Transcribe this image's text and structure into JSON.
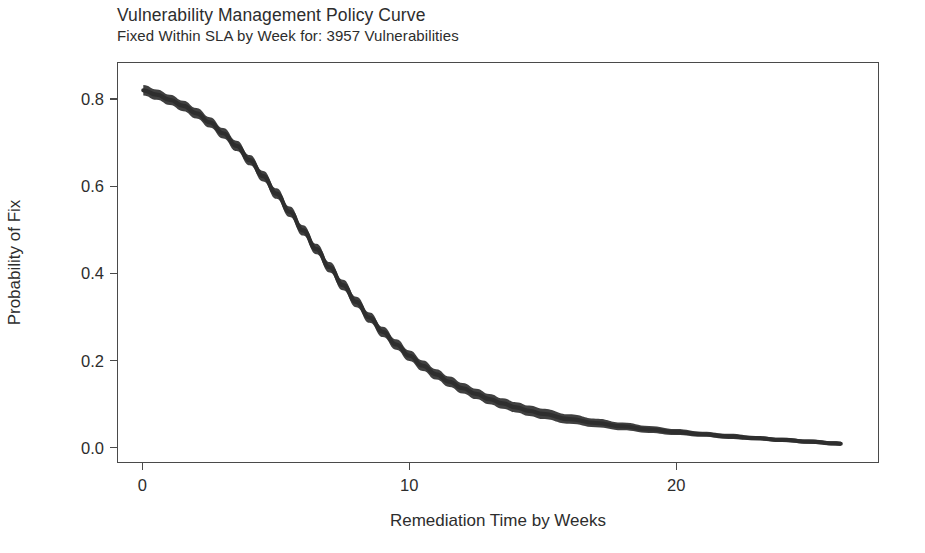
{
  "chart_data": {
    "type": "line",
    "title": "Vulnerability Management Policy Curve",
    "subtitle": "Fixed Within SLA by  Week for: 3957 Vulnerabilities",
    "xlabel": "Remediation Time by Weeks",
    "ylabel": "Probability of Fix",
    "xlim": [
      -0.95,
      27.6
    ],
    "ylim": [
      -0.035,
      0.885
    ],
    "xticks": [
      0,
      10,
      20
    ],
    "xtick_labels": [
      "0",
      "10",
      "20"
    ],
    "yticks": [
      0.0,
      0.2,
      0.4,
      0.6,
      0.8
    ],
    "ytick_labels": [
      "0.0",
      "0.2",
      "0.4",
      "0.6",
      "0.8"
    ],
    "grid": false,
    "legend": "none",
    "line_color": "#2e2e2e",
    "band_color": "#3a3a3a",
    "band_note": "thick dark band = overplotted posterior/bootstrap curves forming a credible interval ribbon",
    "series": [
      {
        "name": "Probability of Fix",
        "x": [
          0,
          0.5,
          1,
          1.5,
          2,
          2.5,
          3,
          3.5,
          4,
          4.5,
          5,
          5.5,
          6,
          6.5,
          7,
          7.5,
          8,
          8.5,
          9,
          9.5,
          10,
          10.5,
          11,
          11.5,
          12,
          12.5,
          13,
          13.5,
          14,
          14.5,
          15,
          16,
          17,
          18,
          19,
          20,
          21,
          22,
          23,
          24,
          25,
          26,
          26.2
        ],
        "values": [
          0.822,
          0.812,
          0.8,
          0.786,
          0.769,
          0.748,
          0.723,
          0.694,
          0.661,
          0.624,
          0.584,
          0.542,
          0.499,
          0.456,
          0.414,
          0.373,
          0.334,
          0.298,
          0.265,
          0.236,
          0.21,
          0.187,
          0.167,
          0.15,
          0.135,
          0.122,
          0.11,
          0.1,
          0.091,
          0.083,
          0.076,
          0.064,
          0.055,
          0.047,
          0.04,
          0.034,
          0.029,
          0.024,
          0.02,
          0.016,
          0.012,
          0.008,
          0.007
        ],
        "band_upper": [
          0.834,
          0.824,
          0.812,
          0.798,
          0.781,
          0.76,
          0.735,
          0.706,
          0.673,
          0.636,
          0.596,
          0.554,
          0.511,
          0.468,
          0.426,
          0.385,
          0.346,
          0.31,
          0.277,
          0.248,
          0.222,
          0.199,
          0.179,
          0.162,
          0.147,
          0.134,
          0.122,
          0.112,
          0.103,
          0.095,
          0.088,
          0.075,
          0.065,
          0.056,
          0.048,
          0.041,
          0.035,
          0.03,
          0.025,
          0.021,
          0.017,
          0.013,
          0.012
        ],
        "band_lower": [
          0.81,
          0.8,
          0.788,
          0.774,
          0.757,
          0.736,
          0.711,
          0.682,
          0.649,
          0.612,
          0.572,
          0.53,
          0.487,
          0.444,
          0.402,
          0.361,
          0.322,
          0.286,
          0.253,
          0.224,
          0.198,
          0.175,
          0.155,
          0.138,
          0.123,
          0.11,
          0.098,
          0.088,
          0.079,
          0.071,
          0.064,
          0.053,
          0.045,
          0.038,
          0.032,
          0.027,
          0.023,
          0.018,
          0.015,
          0.011,
          0.007,
          0.003,
          0.002
        ]
      }
    ],
    "vulnerability_count": 3957
  },
  "figure": {
    "background_color": "#ffffff",
    "panel_border_color": "#4a4a4a",
    "text_color": "#2d2d2d"
  }
}
